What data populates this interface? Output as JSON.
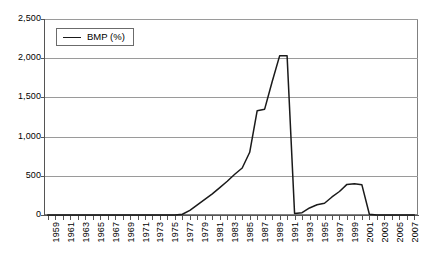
{
  "chart_data": {
    "type": "line",
    "title": "",
    "xlabel": "",
    "ylabel": "",
    "ylim": [
      0,
      2500
    ],
    "xlim": [
      1959,
      2008
    ],
    "grid": true,
    "legend_position": "top-left-inside",
    "y_ticks": [
      "0",
      "500",
      "1,000",
      "1,500",
      "2,000",
      "2,500"
    ],
    "y_tick_values": [
      0,
      500,
      1000,
      1500,
      2000,
      2500
    ],
    "x_ticks": [
      "1959",
      "1961",
      "1963",
      "1965",
      "1967",
      "1969",
      "1971",
      "1973",
      "1975",
      "1977",
      "1979",
      "1981",
      "1983",
      "1985",
      "1987",
      "1989",
      "1991",
      "1993",
      "1995",
      "1997",
      "1999",
      "2001",
      "2003",
      "2005",
      "2007"
    ],
    "series": [
      {
        "name": "BMP (%)",
        "color": "#1a1a1a",
        "x": [
          1959,
          1960,
          1961,
          1962,
          1963,
          1964,
          1965,
          1966,
          1967,
          1968,
          1969,
          1970,
          1971,
          1972,
          1973,
          1974,
          1975,
          1976,
          1977,
          1978,
          1979,
          1980,
          1981,
          1982,
          1983,
          1984,
          1985,
          1986,
          1987,
          1988,
          1989,
          1990,
          1991,
          1992,
          1993,
          1994,
          1995,
          1996,
          1997,
          1998,
          1999,
          2000,
          2001,
          2002,
          2003,
          2004,
          2005,
          2006,
          2007,
          2008
        ],
        "values": [
          0,
          0,
          0,
          0,
          0,
          0,
          0,
          0,
          0,
          0,
          0,
          0,
          0,
          0,
          0,
          0,
          0,
          0,
          10,
          60,
          130,
          200,
          270,
          350,
          430,
          520,
          600,
          800,
          1330,
          1350,
          1700,
          2030,
          2030,
          20,
          30,
          90,
          130,
          150,
          230,
          300,
          390,
          400,
          385,
          10,
          0,
          0,
          0,
          0,
          0,
          0
        ]
      }
    ]
  },
  "legend": {
    "entries": [
      {
        "label": "BMP (%)"
      }
    ]
  }
}
